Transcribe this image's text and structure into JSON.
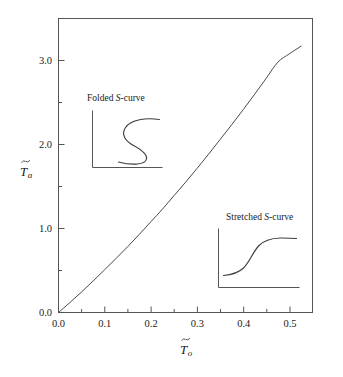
{
  "chart_data": {
    "type": "line",
    "title": "",
    "subtitle": "",
    "xlabel": "T̃o",
    "ylabel": "T̃a",
    "xlabel_parts": {
      "base": "T",
      "tilde": "~",
      "sub": "o"
    },
    "ylabel_parts": {
      "base": "T",
      "tilde": "~",
      "sub": "a"
    },
    "xlim": [
      0.0,
      0.55
    ],
    "ylim": [
      0.0,
      3.5
    ],
    "xticks": [
      0.0,
      0.1,
      0.2,
      0.3,
      0.4,
      0.5
    ],
    "xtick_labels": [
      "0.0",
      "0.1",
      "0.2",
      "0.3",
      "0.4",
      "0.5"
    ],
    "xminor_ticks": [
      0.05,
      0.15,
      0.25,
      0.35,
      0.45,
      0.55
    ],
    "yticks": [
      0.0,
      1.0,
      2.0,
      3.0
    ],
    "ytick_labels": [
      "0.0",
      "1.0",
      "2.0",
      "3.0"
    ],
    "yminor_ticks": [
      0.5,
      1.5,
      2.5,
      3.5
    ],
    "grid": false,
    "legend": null,
    "series": [
      {
        "name": "ignition-extinction boundary",
        "x": [
          0.0,
          0.025,
          0.05,
          0.075,
          0.1,
          0.125,
          0.15,
          0.175,
          0.2,
          0.225,
          0.25,
          0.275,
          0.3,
          0.325,
          0.35,
          0.375,
          0.4,
          0.425,
          0.45,
          0.475,
          0.5,
          0.525
        ],
        "y": [
          0.0,
          0.12,
          0.245,
          0.375,
          0.51,
          0.645,
          0.785,
          0.93,
          1.08,
          1.23,
          1.39,
          1.55,
          1.715,
          1.885,
          2.06,
          2.235,
          2.415,
          2.6,
          2.79,
          2.98,
          3.08,
          3.17
        ]
      }
    ],
    "annotations": [
      {
        "id": "folded-s-curve",
        "label_prefix": "Folded ",
        "label_italic": "S",
        "label_suffix": "-curve",
        "label_full": "Folded S-curve",
        "curve_type": "folded",
        "position": "upper-left"
      },
      {
        "id": "stretched-s-curve",
        "label_prefix": "Stretched ",
        "label_italic": "S",
        "label_suffix": "-curve",
        "label_full": "Stretched S-curve",
        "curve_type": "sigmoid",
        "position": "lower-right"
      }
    ],
    "colors": {
      "background": "#ffffff",
      "axis": "#555555",
      "curve": "#4a4a4a",
      "text": "#1a1a1a"
    }
  }
}
